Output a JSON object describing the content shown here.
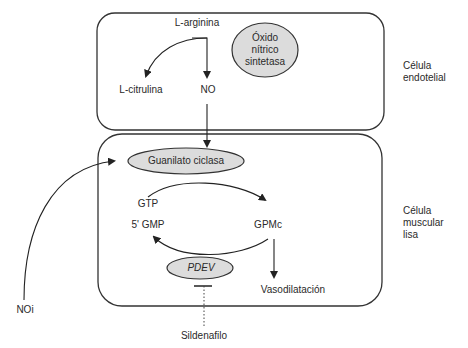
{
  "diagram": {
    "cells": {
      "endothelial": {
        "label_line1": "Célula",
        "label_line2": "endotelial"
      },
      "smooth_muscle": {
        "label_line1": "Célula",
        "label_line2": "muscular",
        "label_line3": "lisa"
      }
    },
    "nodes": {
      "l_arginina": "L-arginina",
      "l_citrulina": "L-citrulina",
      "no": "NO",
      "nos_line1": "Óxido",
      "nos_line2": "nítrico",
      "nos_line3": "sintetasa",
      "guanilato": "Guanilato ciclasa",
      "gtp": "GTP",
      "gmp5": "5' GMP",
      "gpmc": "GPMc",
      "pdev": "PDEV",
      "vasodilatacion": "Vasodilatación",
      "noi": "NOi",
      "sildenafilo": "Sildenafilo"
    },
    "edges": [
      {
        "from": "L-arginina",
        "to": "L-citrulina",
        "type": "arrow"
      },
      {
        "from": "L-arginina",
        "to": "NO",
        "type": "arrow"
      },
      {
        "from": "NO",
        "to": "Guanilato ciclasa",
        "type": "arrow"
      },
      {
        "from": "NOi",
        "to": "Guanilato ciclasa",
        "type": "arrow"
      },
      {
        "from": "GTP",
        "to": "GPMc",
        "type": "arrow"
      },
      {
        "from": "GPMc",
        "to": "5' GMP",
        "type": "arrow"
      },
      {
        "from": "GPMc",
        "to": "Vasodilatación",
        "type": "arrow"
      },
      {
        "from": "Sildenafilo",
        "to": "PDEV",
        "type": "inhibition",
        "style": "dotted"
      }
    ],
    "colors": {
      "oval_fill": "#dcdcdc",
      "stroke": "#333333"
    }
  }
}
